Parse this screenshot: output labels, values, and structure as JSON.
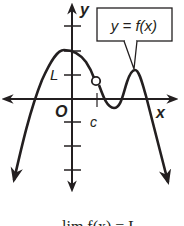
{
  "diagram": {
    "type": "function-graph-limit",
    "axes": {
      "x_label": "x",
      "y_label": "y",
      "origin_label": "O"
    },
    "tick_labels": {
      "y_marked": "L",
      "x_marked": "c"
    },
    "curve_label": "y = f(x)",
    "open_circle": {
      "x": "c",
      "y": "L",
      "meaning": "hole in graph at x = c"
    },
    "caption": "lim f(x) = L",
    "colors": {
      "ink": "#231f20",
      "background": "#ffffff"
    }
  }
}
